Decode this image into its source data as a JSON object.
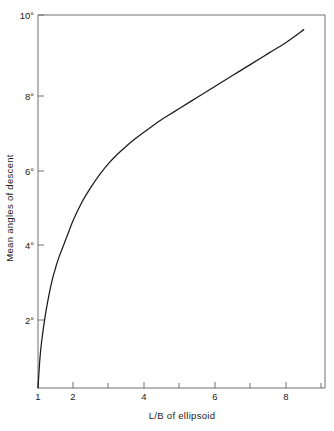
{
  "chart_data": {
    "type": "line",
    "title": "",
    "subtitle": "",
    "xlabel": "L/B of ellipsoid",
    "ylabel": "Mean angles of descent",
    "xlim": [
      1,
      9.1
    ],
    "ylim": [
      0,
      10.2
    ],
    "grid": false,
    "legend": null,
    "xticks": [
      1,
      2,
      4,
      6,
      8
    ],
    "xtick_labels": [
      "1",
      "2",
      "4",
      "6",
      "8"
    ],
    "xminor_ticks": [
      3,
      5,
      7,
      9
    ],
    "yticks": [
      2,
      4,
      6,
      8,
      10
    ],
    "ytick_labels": [
      "2°",
      "4°",
      "6°",
      "8°",
      "10°"
    ],
    "series": [
      {
        "name": "mean angle of descent vs L/B",
        "x": [
          1.0,
          1.05,
          1.1,
          1.2,
          1.3,
          1.4,
          1.5,
          1.6,
          1.8,
          2.0,
          2.25,
          2.5,
          2.75,
          3.0,
          3.25,
          3.5,
          3.75,
          4.0,
          4.25,
          4.5,
          4.75,
          5.0,
          5.5,
          6.0,
          6.5,
          7.0,
          7.5,
          8.0,
          8.5
        ],
        "y": [
          0.0,
          0.75,
          1.25,
          1.95,
          2.5,
          2.95,
          3.3,
          3.6,
          4.1,
          4.6,
          5.1,
          5.5,
          5.85,
          6.15,
          6.4,
          6.62,
          6.82,
          7.0,
          7.18,
          7.35,
          7.5,
          7.65,
          7.95,
          8.25,
          8.55,
          8.85,
          9.15,
          9.45,
          9.8
        ],
        "color": "#1b1b1b"
      }
    ]
  },
  "axes": {
    "x_axis_title": "L/B of ellipsoid",
    "y_axis_title": "Mean angles of descent"
  },
  "colors": {
    "curve": "#1b1b1b",
    "frame": "#6e6e6e",
    "text": "#1a1a1a",
    "background": "#ffffff"
  }
}
